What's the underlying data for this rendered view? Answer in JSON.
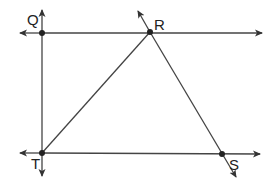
{
  "diagram": {
    "type": "geometry",
    "points": [
      {
        "name": "Q",
        "label": "Q",
        "x": 42,
        "y": 33
      },
      {
        "name": "R",
        "label": "R",
        "x": 150,
        "y": 32
      },
      {
        "name": "T",
        "label": "T",
        "x": 42,
        "y": 153
      },
      {
        "name": "S",
        "label": "S",
        "x": 222,
        "y": 154
      }
    ],
    "lines": [
      {
        "id": "line-QR",
        "desc": "horizontal line through Q and R, arrows both ends"
      },
      {
        "id": "line-TS",
        "desc": "horizontal line through T and S, arrows both ends"
      },
      {
        "id": "line-QT",
        "desc": "vertical line through Q and T, arrows both ends"
      },
      {
        "id": "segment-TR",
        "desc": "segment from T to R"
      },
      {
        "id": "line-RS",
        "desc": "line through R and S, arrows both ends"
      }
    ],
    "colors": {
      "stroke": "#333333",
      "background": "#ffffff"
    }
  }
}
